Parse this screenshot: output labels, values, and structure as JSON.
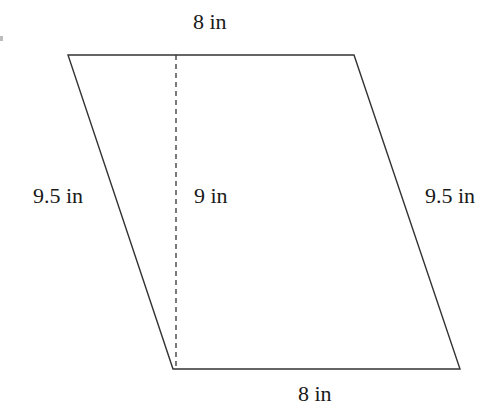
{
  "diagram": {
    "shape": "parallelogram",
    "vertices": {
      "top_left": [
        68,
        55
      ],
      "top_right": [
        354,
        55
      ],
      "bottom_right": [
        460,
        369
      ],
      "bottom_left": [
        173,
        369
      ]
    },
    "height_line": {
      "x": 176,
      "y1": 55,
      "y2": 369,
      "style": "dashed"
    },
    "stroke_color": "#333333",
    "labels": {
      "top": "8 in",
      "bottom": "8 in",
      "left": "9.5 in",
      "right": "9.5 in",
      "height": "9 in"
    }
  }
}
